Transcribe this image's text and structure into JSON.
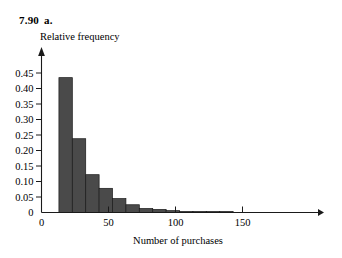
{
  "header": {
    "problem_number": "7.90",
    "part": "a."
  },
  "chart_data": {
    "type": "bar",
    "title": "",
    "xlabel": "Number of purchases",
    "ylabel": "Relative frequency",
    "xlim": [
      0,
      180
    ],
    "ylim": [
      0,
      0.47
    ],
    "xticks": [
      0,
      50,
      100,
      150
    ],
    "xtick_labels": [
      "0",
      "50",
      "100",
      "150"
    ],
    "yticks": [
      0,
      0.05,
      0.1,
      0.15,
      0.2,
      0.25,
      0.3,
      0.35,
      0.4,
      0.45
    ],
    "ytick_labels": [
      "0",
      "0.05",
      "0.10",
      "0.15",
      "0.20",
      "0.25",
      "0.30",
      "0.35",
      "0.40",
      "0.45"
    ],
    "grid": false,
    "legend": false,
    "bin_width": 10,
    "bin_starts": [
      13,
      23,
      33,
      43,
      53,
      63,
      73,
      83,
      93,
      103,
      113,
      123,
      133
    ],
    "categories": [
      "13-23",
      "23-33",
      "33-43",
      "43-53",
      "53-63",
      "63-73",
      "73-83",
      "83-93",
      "93-103",
      "103-113",
      "113-123",
      "123-133",
      "133-143"
    ],
    "values": [
      0.435,
      0.238,
      0.122,
      0.078,
      0.045,
      0.025,
      0.013,
      0.01,
      0.006,
      0.003,
      0.003,
      0.003,
      0.003
    ],
    "bar_color": "#4a4a4a",
    "bar_edge_color": "#1a1a1a",
    "axis_color": "#1a1a1a"
  }
}
